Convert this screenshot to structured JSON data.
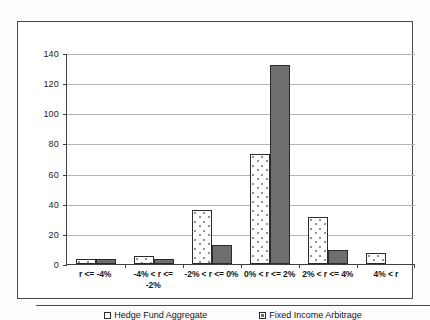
{
  "chart_data": {
    "type": "bar",
    "title": "",
    "subtitle": "",
    "xlabel": "",
    "ylabel": "",
    "ylim": [
      0,
      140
    ],
    "yticks": [
      0,
      20,
      40,
      60,
      80,
      100,
      120,
      140
    ],
    "ytick_labels": [
      "0",
      "20",
      "40",
      "60",
      "80",
      "100",
      "120",
      "140"
    ],
    "grid": true,
    "legend_position": "bottom",
    "categories": [
      "r <= -4%",
      "-4% < r <= -2%",
      "-2% < r <= 0%",
      "0% < r <= 2%",
      "2% < r <= 4%",
      "4% < r"
    ],
    "series": [
      {
        "name": "Hedge Fund Aggregate",
        "fill": "dotted-white",
        "color": "#ffffff",
        "values": [
          3,
          5,
          36,
          73,
          31,
          7
        ]
      },
      {
        "name": "Fixed Income Arbitrage",
        "fill": "solid-gray",
        "color": "#6e6e6e",
        "values": [
          3,
          3.5,
          12.5,
          132,
          9,
          0
        ]
      }
    ]
  },
  "legend": {
    "items": [
      {
        "label": "Hedge Fund Aggregate",
        "swatch": "legend-swatch-white"
      },
      {
        "label": "Fixed Income Arbitrage",
        "swatch": "legend-swatch-gray"
      }
    ]
  }
}
